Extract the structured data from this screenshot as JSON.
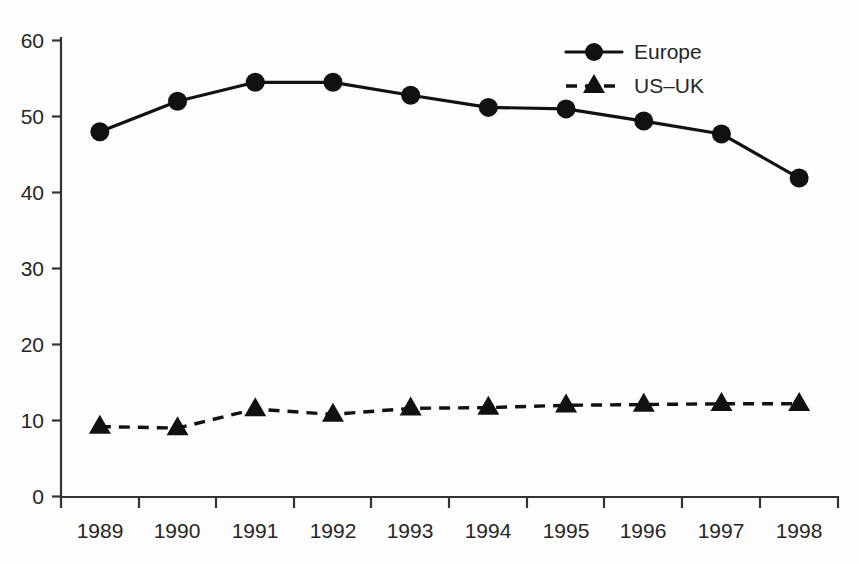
{
  "chart_data": {
    "type": "line",
    "title": "",
    "subtitle": "",
    "xlabel": "",
    "ylabel": "",
    "categories": [
      "1989",
      "1990",
      "1991",
      "1992",
      "1993",
      "1994",
      "1995",
      "1996",
      "1997",
      "1998"
    ],
    "series": [
      {
        "name": "Europe",
        "marker": "circle",
        "linestyle": "solid",
        "color": "#111111",
        "values": [
          48.0,
          52.0,
          54.5,
          54.5,
          52.8,
          51.2,
          51.0,
          49.4,
          47.7,
          41.9
        ]
      },
      {
        "name": "US–UK",
        "marker": "triangle",
        "linestyle": "dashed",
        "color": "#111111",
        "values": [
          9.2,
          9.0,
          11.5,
          10.8,
          11.6,
          11.7,
          12.0,
          12.1,
          12.2,
          12.2
        ]
      }
    ],
    "ylim": [
      0,
      60
    ],
    "yticks": [
      0,
      10,
      20,
      30,
      40,
      50,
      60
    ],
    "ytick_labels": [
      "0",
      "10",
      "20",
      "30",
      "40",
      "50",
      "60"
    ],
    "grid": false,
    "legend_position": "top-right",
    "background_color": "#fdfdfd",
    "axis_color": "#333333"
  },
  "legend": {
    "entries": [
      {
        "label": "Europe"
      },
      {
        "label": "US–UK"
      }
    ]
  },
  "axes": {
    "y_tick_labels": [
      "60",
      "50",
      "40",
      "30",
      "20",
      "10",
      "0"
    ],
    "x_tick_labels": [
      "1989",
      "1990",
      "1991",
      "1992",
      "1993",
      "1994",
      "1995",
      "1996",
      "1997",
      "1998"
    ]
  }
}
